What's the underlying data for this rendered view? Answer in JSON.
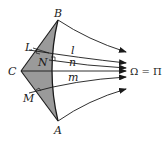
{
  "diagram": {
    "points": {
      "B": "B",
      "A": "A",
      "C": "C",
      "L": "L",
      "N": "N",
      "M": "M"
    },
    "lines": {
      "l": "l",
      "n": "n",
      "m": "m"
    },
    "limit_point_label": "Ω = Π",
    "colors": {
      "shaded_region": "#9a9a9a",
      "stroke": "#1a1a1a",
      "background": "#ffffff"
    }
  }
}
